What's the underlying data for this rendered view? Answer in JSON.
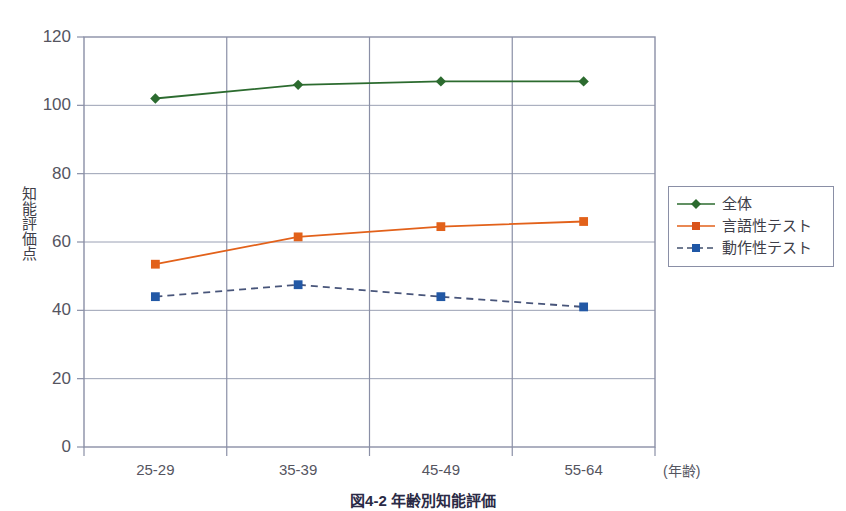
{
  "chart_data": {
    "type": "line",
    "title": "",
    "caption": "図4-2  年齢別知能評価",
    "xlabel": "(年齢)",
    "ylabel": "知能評価点",
    "categories": [
      "25-29",
      "35-39",
      "45-49",
      "55-64"
    ],
    "ylim": [
      0,
      120
    ],
    "yticks": [
      0,
      20,
      40,
      60,
      80,
      100,
      120
    ],
    "grid": "horizontal",
    "legend_position": "right",
    "series": [
      {
        "name": "全体",
        "values": [
          102,
          106,
          107,
          107
        ],
        "color": "#2c6b2f",
        "marker": "diamond",
        "linestyle": "solid"
      },
      {
        "name": "言語性テスト",
        "values": [
          53.5,
          61.5,
          64.5,
          66
        ],
        "color": "#e2611a",
        "marker": "square",
        "linestyle": "solid"
      },
      {
        "name": "動作性テスト",
        "values": [
          44,
          47.5,
          44,
          41
        ],
        "color": "#2258a5",
        "marker": "square",
        "linestyle": "dashed"
      }
    ],
    "axis_color": "#8a8fa6",
    "grid_color": "#9aa0b4",
    "tick_label_color": "#55555f"
  }
}
